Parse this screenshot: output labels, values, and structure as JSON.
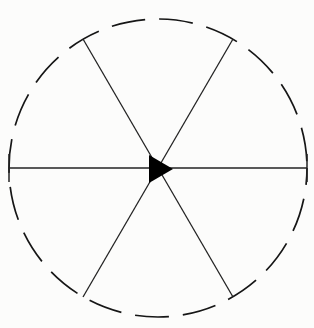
{
  "figure": {
    "name": "dashed-circle-six-spoke-wheel-with-center-arrowhead",
    "title": "",
    "background_color": "#fcfcfb",
    "stroke_color": "#1c1c1c",
    "fill_color": "#000000",
    "canvas": {
      "width": 314,
      "height": 328
    },
    "circle": {
      "center_x": 158,
      "center_y": 168,
      "radius": 149,
      "stroke_width": 1.7,
      "dash_length": 34,
      "gap_length": 14,
      "dash_offset": 17,
      "style": "dashed"
    },
    "spokes": {
      "count": 6,
      "stroke_width": 1.3,
      "angles_deg": [
        0,
        60,
        120,
        180,
        240,
        300
      ],
      "items": [
        {
          "label": "spoke-east",
          "angle_deg": 0,
          "x2": 307,
          "y2": 168
        },
        {
          "label": "spoke-northeast",
          "angle_deg": 60,
          "x2": 233,
          "y2": 39
        },
        {
          "label": "spoke-northwest",
          "angle_deg": 120,
          "x2": 83,
          "y2": 39
        },
        {
          "label": "spoke-west",
          "angle_deg": 180,
          "x2": 9,
          "y2": 168
        },
        {
          "label": "spoke-southwest",
          "angle_deg": 240,
          "x2": 83,
          "y2": 297
        },
        {
          "label": "spoke-southeast",
          "angle_deg": 300,
          "x2": 233,
          "y2": 297
        }
      ]
    },
    "arrowhead": {
      "label": "center-arrowhead",
      "direction": "right",
      "apex_x": 173,
      "apex_y": 169,
      "base_x": 149,
      "base_top_y": 155,
      "base_bottom_y": 183,
      "points": "173,169 149,155 149,183"
    },
    "cap_ticks": [
      {
        "label": "west-endpoint-tick",
        "x": 9,
        "y1": 154,
        "y2": 182
      },
      {
        "label": "east-endpoint-tick",
        "x": 307,
        "y1": 154,
        "y2": 182
      }
    ]
  }
}
